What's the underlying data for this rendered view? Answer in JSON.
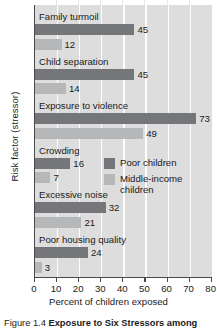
{
  "chart_data": {
    "type": "bar",
    "orientation": "horizontal",
    "title": "",
    "xlabel": "Percent of children exposed",
    "ylabel": "Risk factor (stressor)",
    "xlim": [
      0,
      80
    ],
    "xticks": [
      0,
      10,
      20,
      30,
      40,
      50,
      60,
      70,
      80
    ],
    "grid": true,
    "legend_position": "inside-right-middle",
    "categories": [
      "Family turmoil",
      "Child separation",
      "Exposure to violence",
      "Crowding",
      "Excessive noise",
      "Poor housing quality"
    ],
    "series": [
      {
        "name": "Poor children",
        "color": "#75767a",
        "values": [
          45,
          45,
          73,
          16,
          32,
          24
        ]
      },
      {
        "name": "Middle-income children",
        "color": "#b6b7b9",
        "values": [
          12,
          14,
          49,
          7,
          21,
          3
        ]
      }
    ]
  },
  "legend": {
    "items": [
      {
        "label": "Poor children"
      },
      {
        "label": "Middle-income children"
      }
    ]
  },
  "caption": {
    "prefix": "Figure",
    "number": "1.4",
    "title": "Exposure to Six Stressors among"
  },
  "colors": {
    "poor": "#75767a",
    "middle": "#b6b7b9",
    "plot_background": "#dddddd",
    "gridline": "#fdfdfd",
    "axis": "#4a4a4a",
    "text": "#1a1a1a"
  }
}
